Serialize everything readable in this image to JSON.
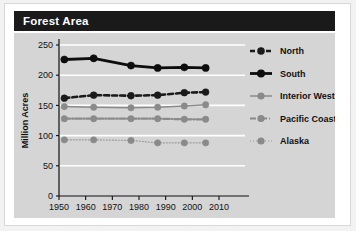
{
  "header": {
    "title": "Forest Area"
  },
  "chart_data": {
    "type": "line",
    "title": "Forest Area",
    "xlabel": "",
    "ylabel": "Million Acres",
    "x": [
      1952,
      1963,
      1977,
      1987,
      1997,
      2005
    ],
    "xlim": [
      1950,
      2010
    ],
    "ylim": [
      0,
      250
    ],
    "xticks": [
      1950,
      1960,
      1970,
      1980,
      1990,
      2000,
      2010
    ],
    "xtick_labels": [
      "1950",
      "1960",
      "1970",
      "1980",
      "1990",
      "2000",
      "2010"
    ],
    "yticks": [
      0,
      50,
      100,
      150,
      200,
      250
    ],
    "ytick_labels": [
      "0",
      "50",
      "100",
      "150",
      "200",
      "250"
    ],
    "grid": "horizontal-white",
    "legend_position": "right",
    "series": [
      {
        "name": "North",
        "values": [
          162,
          167,
          166,
          167,
          171,
          172
        ],
        "color": "#1a1a1a",
        "marker_color": "#1a1a1a",
        "style": "dashed",
        "dasharray": "5,3",
        "width": 2.6,
        "marker_size": 3.4
      },
      {
        "name": "South",
        "values": [
          226,
          228,
          216,
          212,
          213,
          212
        ],
        "color": "#0d0d0d",
        "marker_color": "#0d0d0d",
        "style": "solid",
        "dasharray": "",
        "width": 2.8,
        "marker_size": 3.6
      },
      {
        "name": "Interior West",
        "values": [
          148,
          147,
          146,
          147,
          149,
          151
        ],
        "color": "#8a8a8a",
        "marker_color": "#8a8a8a",
        "style": "solid",
        "dasharray": "",
        "width": 1.5,
        "marker_size": 3.2
      },
      {
        "name": "Pacific Coast",
        "values": [
          128,
          128,
          128,
          128,
          127,
          127
        ],
        "color": "#8a8a8a",
        "marker_color": "#8a8a8a",
        "style": "dash-dot",
        "dasharray": "6,2,1,2",
        "width": 2.2,
        "marker_size": 3.2
      },
      {
        "name": "Alaska",
        "values": [
          93,
          93,
          92,
          88,
          88,
          88
        ],
        "color": "#9a9a9a",
        "marker_color": "#8a8a8a",
        "style": "dotted",
        "dasharray": "1,2",
        "width": 1.2,
        "marker_size": 3.2
      }
    ]
  },
  "legend": {
    "items": [
      {
        "label": "North"
      },
      {
        "label": "South"
      },
      {
        "label": "Interior West"
      },
      {
        "label": "Pacific Coast"
      },
      {
        "label": "Alaska"
      }
    ]
  },
  "colors": {
    "panel_background": "#d5d5d5",
    "title_bar": "#1a1a1a",
    "title_text": "#ffffff",
    "gridline": "#ffffff",
    "axis": "#111111",
    "page_background": "#ffffff"
  }
}
